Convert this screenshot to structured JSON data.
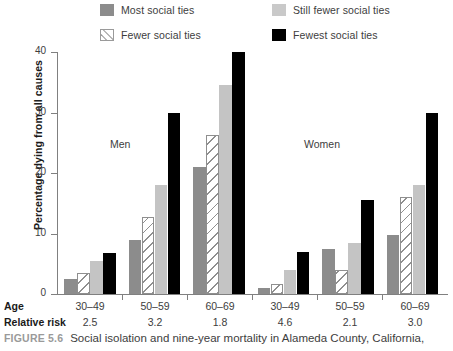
{
  "legend": {
    "items": [
      {
        "label": "Most social ties",
        "swatch": "solid-gray-swatch",
        "color": "#8c8c8c"
      },
      {
        "label": "Still fewer social ties",
        "swatch": "solid-lightgray-swatch",
        "color": "#c9c9c9"
      },
      {
        "label": "Fewer social ties",
        "swatch": "hatched-swatch",
        "color": "#ffffff"
      },
      {
        "label": "Fewest social ties",
        "swatch": "solid-black-swatch",
        "color": "#000000"
      }
    ]
  },
  "panels": [
    {
      "label": "Men"
    },
    {
      "label": "Women"
    }
  ],
  "axis": {
    "y_title": "Percentage dying from all causes",
    "y_ticks": [
      "0",
      "10",
      "20",
      "30",
      "40"
    ]
  },
  "rows": {
    "age_title": "Age",
    "relative_risk_title": "Relative risk",
    "age_values": [
      "30–49",
      "50–59",
      "60–69",
      "30–49",
      "50–59",
      "60–69"
    ],
    "relative_risk_values": [
      "2.5",
      "3.2",
      "1.8",
      "4.6",
      "2.1",
      "3.0"
    ]
  },
  "caption": {
    "figure_number": "FIGURE 5.6",
    "text": "Social isolation and nine-year mortality in Alameda County, California,"
  },
  "chart_data": {
    "type": "bar",
    "title": "Social isolation and nine-year mortality in Alameda County, California,",
    "xlabel": "Age",
    "ylabel": "Percentage dying from all causes",
    "ylim": [
      0,
      40
    ],
    "yticks": [
      0,
      10,
      20,
      30,
      40
    ],
    "grid": false,
    "legend_position": "top",
    "categories": [
      "Men 30–49",
      "Men 50–59",
      "Men 60–69",
      "Women 30–49",
      "Women 50–59",
      "Women 60–69"
    ],
    "group_labels": [
      "30–49",
      "50–59",
      "60–69",
      "30–49",
      "50–59",
      "60–69"
    ],
    "panels": [
      "Men",
      "Men",
      "Men",
      "Women",
      "Women",
      "Women"
    ],
    "relative_risk": [
      2.5,
      3.2,
      1.8,
      4.6,
      2.1,
      3.0
    ],
    "series": [
      {
        "name": "Most social ties",
        "color": "#8c8c8c",
        "values": [
          2.5,
          9.0,
          21.0,
          1.0,
          7.5,
          9.8
        ]
      },
      {
        "name": "Fewer social ties",
        "color": "#ffffff",
        "pattern": "diagonal-hatch",
        "values": [
          3.5,
          12.8,
          26.3,
          1.7,
          4.0,
          16.0
        ]
      },
      {
        "name": "Still fewer social ties",
        "color": "#c4c4c4",
        "values": [
          5.5,
          18.0,
          34.5,
          4.0,
          8.5,
          18.0
        ]
      },
      {
        "name": "Fewest social ties",
        "color": "#000000",
        "values": [
          6.8,
          30.0,
          40.0,
          7.0,
          15.5,
          30.0
        ]
      }
    ]
  }
}
